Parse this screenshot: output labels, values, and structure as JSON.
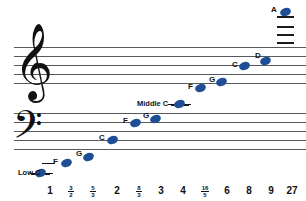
{
  "diagram": {
    "note_color": "#1f4e96",
    "staff_line_color": "#58585a"
  },
  "labels": {
    "middle_c": "Middle C",
    "low_c": "Low C"
  },
  "notes": [
    {
      "name": "Low C",
      "label": "",
      "x": 40,
      "y": 173,
      "ledger": true,
      "ledger_w": 17
    },
    {
      "name": "F",
      "label": "F",
      "x": 66,
      "y": 163,
      "ledger": true,
      "ledger_w": 13
    },
    {
      "name": "G",
      "label": "G",
      "x": 88,
      "y": 157,
      "ledger": false,
      "ledger_w": 0
    },
    {
      "name": "C",
      "label": "C",
      "x": 112,
      "y": 140,
      "ledger": false,
      "ledger_w": 0
    },
    {
      "name": "F",
      "label": "F",
      "x": 135,
      "y": 123,
      "ledger": false,
      "ledger_w": 0
    },
    {
      "name": "G",
      "label": "G",
      "x": 155,
      "y": 119,
      "ledger": false,
      "ledger_w": 0
    },
    {
      "name": "Middle C",
      "label": "",
      "x": 179,
      "y": 104,
      "ledger": true,
      "ledger_w": 17
    },
    {
      "name": "F",
      "label": "F",
      "x": 200,
      "y": 88,
      "ledger": false,
      "ledger_w": 0
    },
    {
      "name": "G",
      "label": "G",
      "x": 221,
      "y": 82,
      "ledger": false,
      "ledger_w": 0
    },
    {
      "name": "C",
      "label": "C",
      "x": 244,
      "y": 66,
      "ledger": false,
      "ledger_w": 0
    },
    {
      "name": "D",
      "label": "D",
      "x": 265,
      "y": 61,
      "ledger": false,
      "ledger_w": 0
    },
    {
      "name": "A",
      "label": "A",
      "x": 285,
      "y": 12,
      "ledger": true,
      "ledger_w": 17
    }
  ],
  "ticks": [
    {
      "text": "1",
      "num": "",
      "den": "",
      "x": 50
    },
    {
      "text": "",
      "num": "3",
      "den": "2",
      "x": 71
    },
    {
      "text": "",
      "num": "5",
      "den": "3",
      "x": 93
    },
    {
      "text": "2",
      "num": "",
      "den": "",
      "x": 117
    },
    {
      "text": "",
      "num": "8",
      "den": "3",
      "x": 139
    },
    {
      "text": "3",
      "num": "",
      "den": "",
      "x": 161
    },
    {
      "text": "4",
      "num": "",
      "den": "",
      "x": 183
    },
    {
      "text": "",
      "num": "16",
      "den": "5",
      "x": 205
    },
    {
      "text": "6",
      "num": "",
      "den": "",
      "x": 227
    },
    {
      "text": "8",
      "num": "",
      "den": "",
      "x": 249
    },
    {
      "text": "9",
      "num": "",
      "den": "",
      "x": 271
    },
    {
      "text": "27",
      "num": "",
      "den": "",
      "x": 292
    }
  ],
  "treble_staff": {
    "lines_y": [
      47,
      56,
      65,
      74,
      83
    ],
    "x": 14,
    "width": 292
  },
  "bass_staff": {
    "lines_y": [
      113,
      122,
      131,
      140,
      149
    ],
    "x": 14,
    "width": 292
  },
  "upper_ledgers": {
    "x": 277,
    "width": 17,
    "lines_y": [
      12,
      22,
      32,
      42
    ]
  },
  "clefs": {
    "treble": "𝄞",
    "bass": "𝄢"
  }
}
